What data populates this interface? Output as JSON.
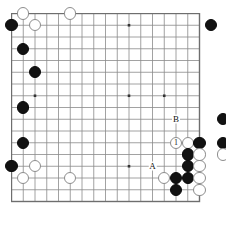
{
  "diagram": {
    "kind": "go-board-problem-diagram",
    "background_color": "#ffffff",
    "board": {
      "size": 19,
      "visible_columns": 17,
      "visible_rows": 17,
      "line_color": "#8a8a8a",
      "border_color": "#6e6e6e",
      "grid_spacing_px": 11.75,
      "origin_x_px": 0.5,
      "origin_y_px": 0.5
    },
    "star_points": [
      {
        "col": 3,
        "row": 8
      },
      {
        "col": 11,
        "row": 2
      },
      {
        "col": 11,
        "row": 8
      },
      {
        "col": 14,
        "row": 8
      },
      {
        "col": 11,
        "row": 14
      }
    ],
    "stones": [
      {
        "id": "w-1",
        "color": "white",
        "col": 2,
        "row": 1,
        "label": ""
      },
      {
        "id": "w-2",
        "color": "white",
        "col": 6,
        "row": 1,
        "label": ""
      },
      {
        "id": "b-1",
        "color": "black",
        "col": 1,
        "row": 2,
        "label": ""
      },
      {
        "id": "w-3",
        "color": "white",
        "col": 3,
        "row": 2,
        "label": ""
      },
      {
        "id": "b-2",
        "color": "black",
        "col": 18,
        "row": 2,
        "label": ""
      },
      {
        "id": "b-3",
        "color": "black",
        "col": 2,
        "row": 4,
        "label": ""
      },
      {
        "id": "b-4",
        "color": "black",
        "col": 3,
        "row": 6,
        "label": ""
      },
      {
        "id": "b-5",
        "color": "black",
        "col": 2,
        "row": 9,
        "label": ""
      },
      {
        "id": "b-6",
        "color": "black",
        "col": 2,
        "row": 12,
        "label": ""
      },
      {
        "id": "b-7",
        "color": "black",
        "col": 1,
        "row": 14,
        "label": ""
      },
      {
        "id": "w-4",
        "color": "white",
        "col": 3,
        "row": 14,
        "label": ""
      },
      {
        "id": "w-5",
        "color": "white",
        "col": 2,
        "row": 15,
        "label": ""
      },
      {
        "id": "w-6",
        "color": "white",
        "col": 6,
        "row": 15,
        "label": ""
      },
      {
        "id": "b-8",
        "color": "black",
        "col": 19,
        "row": 10,
        "label": ""
      },
      {
        "id": "w-move-1",
        "color": "white",
        "col": 15,
        "row": 12,
        "label": "1"
      },
      {
        "id": "w-7",
        "color": "white",
        "col": 16,
        "row": 12,
        "label": ""
      },
      {
        "id": "b-9",
        "color": "black",
        "col": 17,
        "row": 12,
        "label": ""
      },
      {
        "id": "b-10",
        "color": "black",
        "col": 19,
        "row": 12,
        "label": ""
      },
      {
        "id": "b-11",
        "color": "black",
        "col": 16,
        "row": 13,
        "label": ""
      },
      {
        "id": "w-8",
        "color": "white",
        "col": 17,
        "row": 13,
        "label": ""
      },
      {
        "id": "w-9",
        "color": "white",
        "col": 19,
        "row": 13,
        "label": ""
      },
      {
        "id": "b-12",
        "color": "black",
        "col": 16,
        "row": 14,
        "label": ""
      },
      {
        "id": "w-10",
        "color": "white",
        "col": 17,
        "row": 14,
        "label": ""
      },
      {
        "id": "w-11",
        "color": "white",
        "col": 14,
        "row": 15,
        "label": ""
      },
      {
        "id": "b-13",
        "color": "black",
        "col": 15,
        "row": 15,
        "label": ""
      },
      {
        "id": "b-14",
        "color": "black",
        "col": 16,
        "row": 15,
        "label": ""
      },
      {
        "id": "w-12",
        "color": "white",
        "col": 17,
        "row": 15,
        "label": ""
      },
      {
        "id": "b-15",
        "color": "black",
        "col": 15,
        "row": 16,
        "label": ""
      },
      {
        "id": "w-13",
        "color": "white",
        "col": 17,
        "row": 16,
        "label": ""
      }
    ],
    "point_labels": [
      {
        "id": "label-B",
        "text": "B",
        "col": 15,
        "row": 10
      },
      {
        "id": "label-A",
        "text": "A",
        "col": 13,
        "row": 14
      }
    ]
  }
}
